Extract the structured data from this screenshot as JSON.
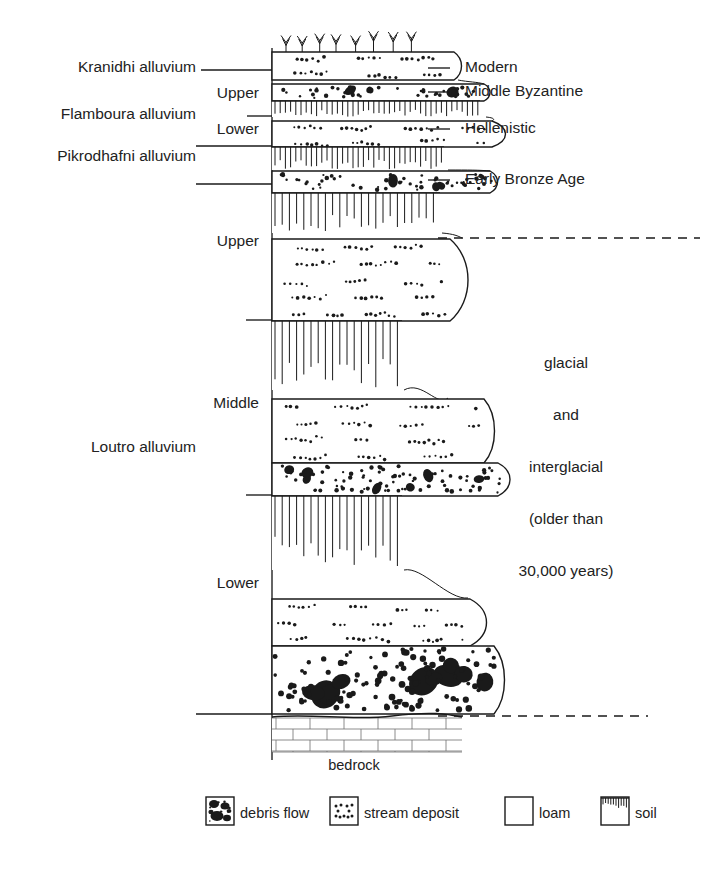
{
  "figure": {
    "bedrock_label": "bedrock"
  },
  "left_labels": [
    {
      "id": "kranidhi",
      "text": "Kranidhi alluvium",
      "x": 196,
      "y": 72
    },
    {
      "id": "flamboura",
      "text": "Flamboura alluvium",
      "x": 196,
      "y": 119
    },
    {
      "id": "pikrodhafni",
      "text": "Pikrodhafni alluvium",
      "x": 196,
      "y": 161
    },
    {
      "id": "loutro",
      "text": "Loutro alluvium",
      "x": 196,
      "y": 452
    }
  ],
  "sub_labels": [
    {
      "id": "flamboura-upper",
      "text": "Upper",
      "x": 259,
      "y": 98
    },
    {
      "id": "flamboura-lower",
      "text": "Lower",
      "x": 259,
      "y": 134
    },
    {
      "id": "loutro-upper",
      "text": "Upper",
      "x": 259,
      "y": 246
    },
    {
      "id": "loutro-middle",
      "text": "Middle",
      "x": 259,
      "y": 408
    },
    {
      "id": "loutro-lower",
      "text": "Lower",
      "x": 259,
      "y": 588
    }
  ],
  "right_labels": [
    {
      "id": "modern",
      "text": "Modern",
      "x": 465,
      "y": 72
    },
    {
      "id": "middle-byzantine",
      "text": "Middle Byzantine",
      "x": 465,
      "y": 96
    },
    {
      "id": "hellenistic",
      "text": "Hellenistic",
      "x": 465,
      "y": 133
    },
    {
      "id": "early-bronze-age",
      "text": "Early Bronze Age",
      "x": 465,
      "y": 184
    }
  ],
  "right_age_block": [
    {
      "id": "glacial",
      "text": "glacial",
      "x": 566,
      "y": 368
    },
    {
      "id": "and",
      "text": "and",
      "x": 566,
      "y": 420
    },
    {
      "id": "interglacial",
      "text": "interglacial",
      "x": 566,
      "y": 472
    },
    {
      "id": "older-than",
      "text": "(older than",
      "x": 566,
      "y": 524
    },
    {
      "id": "years",
      "text": "30,000 years)",
      "x": 566,
      "y": 576
    }
  ],
  "legend": {
    "items": [
      {
        "id": "debris-flow",
        "label": "debris flow",
        "pattern": "debris",
        "box_x": 206,
        "text_x": 240
      },
      {
        "id": "stream-deposit",
        "label": "stream deposit",
        "pattern": "stream",
        "box_x": 330,
        "text_x": 364
      },
      {
        "id": "loam",
        "label": "loam",
        "pattern": "loam",
        "box_x": 505,
        "text_x": 539
      },
      {
        "id": "soil",
        "label": "soil",
        "pattern": "soil",
        "box_x": 601,
        "text_x": 635
      }
    ],
    "box_y": 797,
    "box_size": 28,
    "text_y": 818
  },
  "chart_data": {
    "type": "diagram",
    "subtype": "stratigraphic-column",
    "column_axis_x": 272,
    "column_top_y": 52,
    "column_bottom_y": 714,
    "units": [
      {
        "name": "Kranidhi alluvium",
        "subdivision": null,
        "age": "Modern",
        "top_y": 52,
        "base_y": 80,
        "beds": [
          {
            "lithology": "stream deposit",
            "top": 52,
            "base": 80
          }
        ],
        "surface": "vegetated (grass tufts)"
      },
      {
        "name": "Flamboura alluvium",
        "subdivision": "Upper",
        "age": "Middle Byzantine",
        "top_y": 84,
        "base_y": 116,
        "beds": [
          {
            "lithology": "debris flow",
            "top": 84,
            "base": 100
          },
          {
            "lithology": "soil",
            "top": 100,
            "base": 116
          }
        ]
      },
      {
        "name": "Flamboura alluvium",
        "subdivision": "Lower",
        "age": "Hellenistic",
        "top_y": 120,
        "base_y": 168,
        "beds": [
          {
            "lithology": "stream deposit",
            "top": 120,
            "base": 146
          },
          {
            "lithology": "soil",
            "top": 146,
            "base": 168
          }
        ]
      },
      {
        "name": "Pikrodhafni alluvium",
        "subdivision": null,
        "age": "Early Bronze Age",
        "top_y": 168,
        "base_y": 232,
        "beds": [
          {
            "lithology": "debris flow",
            "top": 168,
            "base": 192
          },
          {
            "lithology": "soil",
            "top": 192,
            "base": 232
          }
        ]
      },
      {
        "name": "Loutro alluvium",
        "subdivision": "Upper",
        "age": "glacial and interglacial (older than 30,000 years)",
        "top_y": 238,
        "base_y": 388,
        "beds": [
          {
            "lithology": "stream deposit",
            "top": 238,
            "base": 320
          },
          {
            "lithology": "soil",
            "top": 320,
            "base": 388
          }
        ]
      },
      {
        "name": "Loutro alluvium",
        "subdivision": "Middle",
        "age": "glacial and interglacial (older than 30,000 years)",
        "top_y": 398,
        "base_y": 568,
        "beds": [
          {
            "lithology": "stream deposit",
            "top": 398,
            "base": 462
          },
          {
            "lithology": "debris flow",
            "top": 462,
            "base": 495
          },
          {
            "lithology": "soil",
            "top": 495,
            "base": 568
          }
        ]
      },
      {
        "name": "Loutro alluvium",
        "subdivision": "Lower",
        "age": "glacial and interglacial (older than 30,000 years)",
        "top_y": 598,
        "base_y": 714,
        "beds": [
          {
            "lithology": "stream deposit",
            "top": 598,
            "base": 645
          },
          {
            "lithology": "debris flow",
            "top": 645,
            "base": 714
          }
        ]
      },
      {
        "name": "bedrock",
        "subdivision": null,
        "age": null,
        "top_y": 716,
        "base_y": 752,
        "beds": [
          {
            "lithology": "bedrock (brick ornament)",
            "top": 716,
            "base": 752
          }
        ]
      }
    ],
    "leader_lines_left": [
      {
        "label": "Kranidhi alluvium",
        "y": 70,
        "x1": 201,
        "x2": 272
      },
      {
        "label": "Flamboura alluvium",
        "y": 116,
        "x1": 247,
        "x2": 272
      },
      {
        "label": "Flamboura/Pikrodhafni boundary",
        "y": 146,
        "x1": 196,
        "x2": 272
      },
      {
        "label": "Pikrodhafni base",
        "y": 184,
        "x1": 196,
        "x2": 272
      },
      {
        "label": "Loutro Upper base",
        "y": 320,
        "x1": 246,
        "x2": 272
      },
      {
        "label": "Loutro Middle base",
        "y": 495,
        "x1": 246,
        "x2": 272
      },
      {
        "label": "Loutro Lower base",
        "y": 714,
        "x1": 196,
        "x2": 272
      }
    ],
    "leader_lines_right": [
      {
        "label": "Modern",
        "y": 68,
        "x1": 428,
        "x2": 450
      },
      {
        "label": "Middle Byzantine",
        "y": 92,
        "x1": 428,
        "x2": 450
      },
      {
        "label": "Hellenistic",
        "y": 129,
        "x1": 428,
        "x2": 450
      },
      {
        "label": "Early Bronze Age",
        "y": 180,
        "x1": 428,
        "x2": 450
      }
    ],
    "dashed_boundaries": [
      {
        "label": "top of glacial/interglacial sequence",
        "y": 238,
        "x1": 438,
        "x2": 700
      },
      {
        "label": "base of alluvium / bedrock contact",
        "y": 716,
        "x1": 438,
        "x2": 648
      }
    ],
    "legend_keys": [
      "debris flow",
      "stream deposit",
      "loam",
      "soil"
    ]
  }
}
